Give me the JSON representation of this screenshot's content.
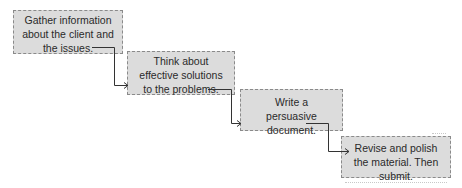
{
  "diagram": {
    "type": "staircase-flowchart",
    "box_fill": "#dcdcdc",
    "box_border": "#8a8a8a",
    "connector_color": "#333333",
    "steps": [
      {
        "id": 1,
        "text": "Gather information about the client and the issues."
      },
      {
        "id": 2,
        "text": "Think about effective solutions to the problems."
      },
      {
        "id": 3,
        "text": "Write a persuasive document."
      },
      {
        "id": 4,
        "text": "Revise and polish the material. Then submit."
      }
    ],
    "connectors": [
      {
        "from": 1,
        "to": 2
      },
      {
        "from": 2,
        "to": 3
      },
      {
        "from": 3,
        "to": 4
      }
    ]
  }
}
